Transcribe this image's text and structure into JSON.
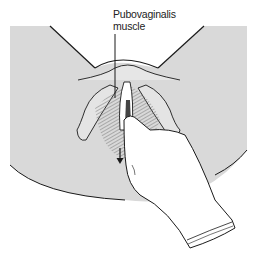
{
  "figure": {
    "label_line1": "Pubovaginalis",
    "label_line2": "muscle",
    "colors": {
      "skin": "#d9d9d9",
      "outline": "#1a1a1a",
      "glove": "#ffffff",
      "muscle": "#a8a8a8"
    }
  }
}
